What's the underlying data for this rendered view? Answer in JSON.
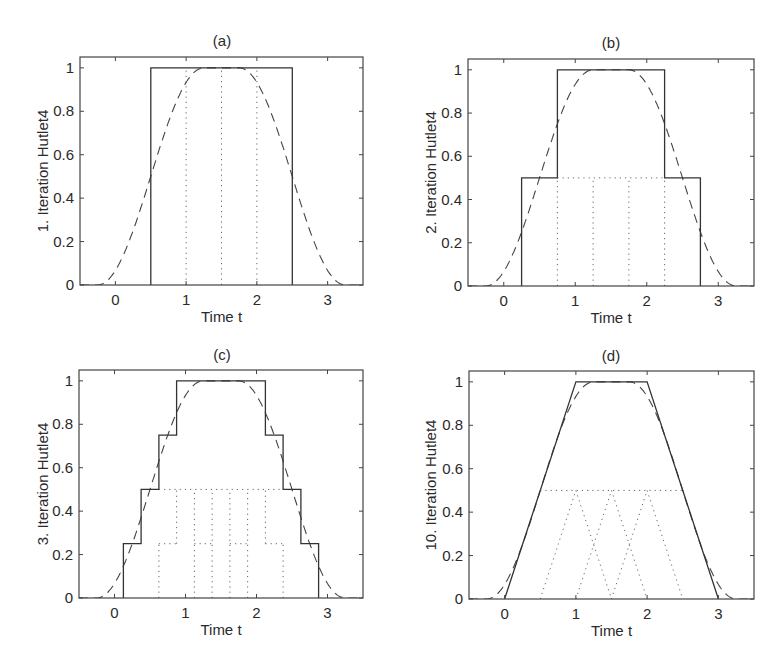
{
  "figure": {
    "panels": [
      {
        "id": "a",
        "title": "(a)",
        "ylabel": "1. Iteration Hutlet4",
        "xlabel": "Time t"
      },
      {
        "id": "b",
        "title": "(b)",
        "ylabel": "2. Iteration Hutlet4",
        "xlabel": "Time t"
      },
      {
        "id": "c",
        "title": "(c)",
        "ylabel": "3. Iteration Hutlet4",
        "xlabel": "Time t"
      },
      {
        "id": "d",
        "title": "(d)",
        "ylabel": "10. Iteration Hutlet4",
        "xlabel": "Time t"
      }
    ]
  },
  "chart_data": [
    {
      "type": "line",
      "title": "(a)",
      "xlabel": "Time t",
      "ylabel": "1. Iteration Hutlet4",
      "xlim": [
        -0.5,
        3.5
      ],
      "ylim": [
        0,
        1.05
      ],
      "xticks": [
        0,
        1,
        2,
        3
      ],
      "yticks": [
        0,
        0.2,
        0.4,
        0.6,
        0.8,
        1
      ],
      "ytick_labels": [
        "0",
        "0.2",
        "0.4",
        "0.6",
        "0.8",
        "1"
      ],
      "grid": false,
      "series": [
        {
          "name": "target (dashed)",
          "style": "dashed",
          "function": "smooth bump",
          "x": [
            -0.25,
            0,
            0.25,
            0.5,
            0.75,
            1,
            1.25,
            1.5,
            1.75,
            2,
            2.25,
            2.5,
            2.75,
            3,
            3.25
          ],
          "y": [
            0,
            0.07,
            0.25,
            0.5,
            0.75,
            0.93,
            1,
            1,
            1,
            0.93,
            0.75,
            0.5,
            0.25,
            0.07,
            0
          ]
        },
        {
          "name": "iterate (solid)",
          "style": "solid",
          "x": [
            0.5,
            0.5,
            2.5,
            2.5
          ],
          "y": [
            0,
            1,
            1,
            0
          ]
        },
        {
          "name": "components (dotted)",
          "style": "dotted",
          "segments": [
            [
              [
                1,
                0
              ],
              [
                1,
                1
              ]
            ],
            [
              [
                1.5,
                0
              ],
              [
                1.5,
                1
              ]
            ],
            [
              [
                2,
                0
              ],
              [
                2,
                1
              ]
            ]
          ]
        }
      ]
    },
    {
      "type": "line",
      "title": "(b)",
      "xlabel": "Time t",
      "ylabel": "2. Iteration Hutlet4",
      "xlim": [
        -0.5,
        3.5
      ],
      "ylim": [
        0,
        1.05
      ],
      "xticks": [
        0,
        1,
        2,
        3
      ],
      "yticks": [
        0,
        0.2,
        0.4,
        0.6,
        0.8,
        1
      ],
      "ytick_labels": [
        "0",
        "0.2",
        "0.4",
        "0.6",
        "0.8",
        "1"
      ],
      "grid": false,
      "series": [
        {
          "name": "target (dashed)",
          "style": "dashed",
          "function": "smooth bump",
          "x": [
            -0.25,
            0,
            0.25,
            0.5,
            0.75,
            1,
            1.25,
            1.5,
            1.75,
            2,
            2.25,
            2.5,
            2.75,
            3,
            3.25
          ],
          "y": [
            0,
            0.07,
            0.25,
            0.5,
            0.75,
            0.93,
            1,
            1,
            1,
            0.93,
            0.75,
            0.5,
            0.25,
            0.07,
            0
          ]
        },
        {
          "name": "iterate (solid)",
          "style": "solid",
          "x": [
            0.25,
            0.25,
            0.75,
            0.75,
            2.25,
            2.25,
            2.75,
            2.75
          ],
          "y": [
            0,
            0.5,
            0.5,
            1,
            1,
            0.5,
            0.5,
            0
          ]
        },
        {
          "name": "components (dotted)",
          "style": "dotted",
          "segments": [
            [
              [
                0.75,
                0.5
              ],
              [
                2.25,
                0.5
              ]
            ],
            [
              [
                0.75,
                0
              ],
              [
                0.75,
                0.5
              ]
            ],
            [
              [
                1.25,
                0
              ],
              [
                1.25,
                0.5
              ]
            ],
            [
              [
                1.75,
                0
              ],
              [
                1.75,
                0.5
              ]
            ],
            [
              [
                2.25,
                0
              ],
              [
                2.25,
                0.5
              ]
            ]
          ]
        }
      ]
    },
    {
      "type": "line",
      "title": "(c)",
      "xlabel": "Time t",
      "ylabel": "3. Iteration Hutlet4",
      "xlim": [
        -0.5,
        3.5
      ],
      "ylim": [
        0,
        1.05
      ],
      "xticks": [
        0,
        1,
        2,
        3
      ],
      "yticks": [
        0,
        0.2,
        0.4,
        0.6,
        0.8,
        1
      ],
      "ytick_labels": [
        "0",
        "0.2",
        "0.4",
        "0.6",
        "0.8",
        "1"
      ],
      "grid": false,
      "series": [
        {
          "name": "target (dashed)",
          "style": "dashed",
          "function": "smooth bump",
          "x": [
            -0.25,
            0,
            0.25,
            0.5,
            0.75,
            1,
            1.25,
            1.5,
            1.75,
            2,
            2.25,
            2.5,
            2.75,
            3,
            3.25
          ],
          "y": [
            0,
            0.07,
            0.25,
            0.5,
            0.75,
            0.93,
            1,
            1,
            1,
            0.93,
            0.75,
            0.5,
            0.25,
            0.07,
            0
          ]
        },
        {
          "name": "iterate (solid)",
          "style": "solid",
          "x": [
            0.125,
            0.125,
            0.375,
            0.375,
            0.625,
            0.625,
            0.875,
            0.875,
            2.125,
            2.125,
            2.375,
            2.375,
            2.625,
            2.625,
            2.875,
            2.875
          ],
          "y": [
            0,
            0.25,
            0.25,
            0.5,
            0.5,
            0.75,
            0.75,
            1,
            1,
            0.75,
            0.75,
            0.5,
            0.5,
            0.25,
            0.25,
            0
          ]
        },
        {
          "name": "components (dotted)",
          "style": "dotted",
          "segments": [
            [
              [
                0.625,
                0.5
              ],
              [
                2.375,
                0.5
              ]
            ],
            [
              [
                0.625,
                0.25
              ],
              [
                0.875,
                0.25
              ]
            ],
            [
              [
                1.125,
                0.25
              ],
              [
                1.375,
                0.25
              ]
            ],
            [
              [
                1.625,
                0.25
              ],
              [
                1.875,
                0.25
              ]
            ],
            [
              [
                2.125,
                0.25
              ],
              [
                2.375,
                0.25
              ]
            ],
            [
              [
                0.625,
                0
              ],
              [
                0.625,
                0.25
              ]
            ],
            [
              [
                0.875,
                0.25
              ],
              [
                0.875,
                0.5
              ]
            ],
            [
              [
                1.125,
                0
              ],
              [
                1.125,
                0.5
              ]
            ],
            [
              [
                1.375,
                0
              ],
              [
                1.375,
                0.5
              ]
            ],
            [
              [
                1.625,
                0
              ],
              [
                1.625,
                0.5
              ]
            ],
            [
              [
                1.875,
                0
              ],
              [
                1.875,
                0.5
              ]
            ],
            [
              [
                2.125,
                0.25
              ],
              [
                2.125,
                0.5
              ]
            ],
            [
              [
                2.375,
                0
              ],
              [
                2.375,
                0.25
              ]
            ]
          ]
        }
      ]
    },
    {
      "type": "line",
      "title": "(d)",
      "xlabel": "Time t",
      "ylabel": "10. Iteration Hutlet4",
      "xlim": [
        -0.5,
        3.5
      ],
      "ylim": [
        0,
        1.05
      ],
      "xticks": [
        0,
        1,
        2,
        3
      ],
      "yticks": [
        0,
        0.2,
        0.4,
        0.6,
        0.8,
        1
      ],
      "ytick_labels": [
        "0",
        "0.2",
        "0.4",
        "0.6",
        "0.8",
        "1"
      ],
      "grid": false,
      "series": [
        {
          "name": "target (dashed)",
          "style": "dashed",
          "function": "smooth bump",
          "x": [
            -0.25,
            0,
            0.25,
            0.5,
            0.75,
            1,
            1.25,
            1.5,
            1.75,
            2,
            2.25,
            2.5,
            2.75,
            3,
            3.25
          ],
          "y": [
            0,
            0.07,
            0.25,
            0.5,
            0.75,
            0.93,
            1,
            1,
            1,
            0.93,
            0.75,
            0.5,
            0.25,
            0.07,
            0
          ]
        },
        {
          "name": "iterate (solid)",
          "style": "solid",
          "x": [
            0,
            1,
            2,
            3
          ],
          "y": [
            0,
            1,
            1,
            0
          ]
        },
        {
          "name": "components (dotted)",
          "style": "dotted",
          "segments": [
            [
              [
                0.5,
                0.5
              ],
              [
                2.5,
                0.5
              ]
            ],
            [
              [
                0.5,
                0
              ],
              [
                1,
                0.5
              ]
            ],
            [
              [
                1,
                0.5
              ],
              [
                1.5,
                0
              ]
            ],
            [
              [
                1,
                0
              ],
              [
                1.5,
                0.5
              ]
            ],
            [
              [
                1.5,
                0.5
              ],
              [
                2,
                0
              ]
            ],
            [
              [
                1.5,
                0
              ],
              [
                2,
                0.5
              ]
            ],
            [
              [
                2,
                0.5
              ],
              [
                2.5,
                0
              ]
            ]
          ]
        }
      ]
    }
  ]
}
